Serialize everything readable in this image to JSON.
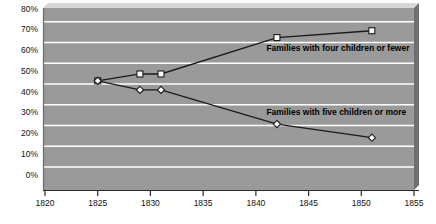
{
  "chart_data": {
    "type": "line",
    "title": "",
    "subtitle": "",
    "xlabel": "",
    "ylabel": "",
    "xlim": [
      1820,
      1855
    ],
    "ylim": [
      0,
      80
    ],
    "x_ticks": [
      1820,
      1825,
      1830,
      1835,
      1840,
      1845,
      1850,
      1855
    ],
    "x_tick_labels": [
      "1820",
      "1825",
      "1830",
      "1835",
      "1840",
      "1845",
      "1850",
      "1855"
    ],
    "y_ticks": [
      0,
      10,
      20,
      30,
      40,
      50,
      60,
      70,
      80
    ],
    "y_tick_labels": [
      "0%",
      "10%",
      "20%",
      "30%",
      "40%",
      "50%",
      "60%",
      "70%",
      "80%"
    ],
    "grid": "horizontal",
    "legend_position": "inline-annotation",
    "plot_background": "#9a9a9a",
    "gridline_color": "#ffffff",
    "line_color": "#1a1a1a",
    "marker_fill": "#ffffff",
    "series": [
      {
        "name": "Families with four children or fewer",
        "marker": "square",
        "x": [
          1825,
          1829,
          1831,
          1842,
          1851
        ],
        "values": [
          48,
          51,
          51,
          67,
          70
        ],
        "label_text": "Families with four children or fewer",
        "label_x": 1841,
        "label_y": 61
      },
      {
        "name": "Families with five children or more",
        "marker": "diamond",
        "x": [
          1825,
          1829,
          1831,
          1842,
          1851
        ],
        "values": [
          48,
          44,
          44,
          29,
          23
        ],
        "label_text": "Families with five children or more",
        "label_x": 1841,
        "label_y": 33
      }
    ]
  }
}
